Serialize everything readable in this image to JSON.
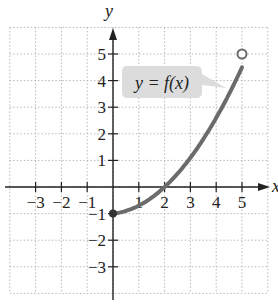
{
  "chart_data": {
    "type": "line",
    "title": "",
    "xlabel": "x",
    "ylabel": "y",
    "xlim": [
      -4,
      6
    ],
    "ylim": [
      -4,
      6
    ],
    "grid": true,
    "x_ticks": [
      "-3",
      "-2",
      "-1",
      "1",
      "2",
      "3",
      "4",
      "5"
    ],
    "y_ticks": [
      "5",
      "4",
      "3",
      "2",
      "1",
      "-1",
      "-2",
      "-3"
    ],
    "annotation": "y = f(x)",
    "series": [
      {
        "name": "f(x)",
        "x": [
          0,
          1,
          2,
          3,
          4,
          5
        ],
        "y": [
          -1,
          -0.6,
          0,
          1.1,
          2.8,
          5
        ],
        "start_point": {
          "x": 0,
          "y": -1,
          "style": "closed"
        },
        "end_point": {
          "x": 5,
          "y": 5,
          "style": "open"
        }
      }
    ]
  },
  "labels": {
    "x_axis": "x",
    "y_axis": "y",
    "callout": "y = f(x)"
  },
  "ticks": {
    "x": [
      {
        "v": -3,
        "t": "−3"
      },
      {
        "v": -2,
        "t": "−2"
      },
      {
        "v": -1,
        "t": "−1"
      },
      {
        "v": 1,
        "t": "1"
      },
      {
        "v": 2,
        "t": "2"
      },
      {
        "v": 3,
        "t": "3"
      },
      {
        "v": 4,
        "t": "4"
      },
      {
        "v": 5,
        "t": "5"
      }
    ],
    "y": [
      {
        "v": 5,
        "t": "5"
      },
      {
        "v": 4,
        "t": "4"
      },
      {
        "v": 3,
        "t": "3"
      },
      {
        "v": 2,
        "t": "2"
      },
      {
        "v": 1,
        "t": "1"
      },
      {
        "v": -1,
        "t": "−1"
      },
      {
        "v": -2,
        "t": "−2"
      },
      {
        "v": -3,
        "t": "−3"
      }
    ]
  },
  "colors": {
    "curve": "#6b6b6b",
    "grid": "#b8b8b8",
    "axis": "#222222",
    "callout_bg": "#dcdcdc"
  }
}
